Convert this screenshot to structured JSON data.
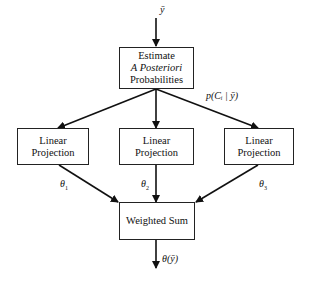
{
  "input_label": "ȳ",
  "estimate_box": {
    "line1": "Estimate",
    "line2": "A Posteriori",
    "line3": "Probabilities"
  },
  "posterior_label": "p(Cᵢ | ȳ)",
  "projections": [
    {
      "label": "Linear Projection",
      "theta": "θ",
      "theta_sub": "1"
    },
    {
      "label": "Linear Projection",
      "theta": "θ",
      "theta_sub": "2"
    },
    {
      "label": "Linear Projection",
      "theta": "θ",
      "theta_sub": "3"
    }
  ],
  "sum_box": {
    "label": "Weighted Sum"
  },
  "output_label": "θ(ȳ)"
}
